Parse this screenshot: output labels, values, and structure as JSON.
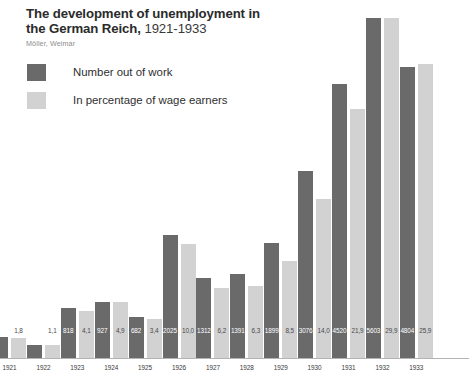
{
  "header": {
    "title_main": "The development of unemployment in the German Reich,",
    "title_line1": "The development of unemployment in",
    "title_line2": "the German Reich,",
    "title_years": "1921-1933",
    "subtitle": "Möller, Weimar"
  },
  "legend": {
    "items": [
      {
        "label": "Number out of work",
        "color": "#6a6a6a",
        "swatch_name": "legend-swatch-dark"
      },
      {
        "label": "In percentage of wage earners",
        "color": "#d2d2d2",
        "swatch_name": "legend-swatch-light"
      }
    ]
  },
  "colors": {
    "bar_dark": "#6a6a6a",
    "bar_light": "#d2d2d2",
    "axis": "#b4b4b4",
    "title": "#2b2b2b",
    "subtitle": "#8d8d8d",
    "background": "#ffffff"
  },
  "chart_data": {
    "type": "bar",
    "title": "The development of unemployment in the German Reich, 1921-1933",
    "subtitle": "Möller, Weimar",
    "xlabel": "",
    "ylabel": "",
    "grid": false,
    "legend_position": "top-left",
    "categories": [
      "1921",
      "1922",
      "1923",
      "1924",
      "1925",
      "1926",
      "1927",
      "1928",
      "1929",
      "1930",
      "1931",
      "1932",
      "1933"
    ],
    "series": [
      {
        "name": "Number out of work",
        "color": "#6a6a6a",
        "unit": "thousands",
        "values": [
          346,
          215,
          818,
          927,
          682,
          2025,
          1312,
          1391,
          1899,
          3076,
          4520,
          5603,
          4804
        ],
        "labels": [
          "346",
          "215",
          "818",
          "927",
          "682",
          "2025",
          "1312",
          "1391",
          "1899",
          "3076",
          "4520",
          "5603",
          "4804"
        ]
      },
      {
        "name": "In percentage of wage earners",
        "color": "#d2d2d2",
        "unit": "percent",
        "values": [
          1.8,
          1.1,
          4.1,
          4.9,
          3.4,
          10.0,
          6.2,
          6.3,
          8.5,
          14.0,
          21.9,
          29.9,
          25.9
        ],
        "labels": [
          "1,8",
          "1,1",
          "4,1",
          "4,9",
          "3,4",
          "10,0",
          "6,2",
          "6,3",
          "8,5",
          "14,0",
          "21,9",
          "29,9",
          "25,9"
        ]
      }
    ],
    "ylim_left": [
      0,
      5900
    ],
    "ylim_right": [
      0,
      31.5
    ],
    "note": "1932 bars are clipped by the top edge of the figure"
  }
}
